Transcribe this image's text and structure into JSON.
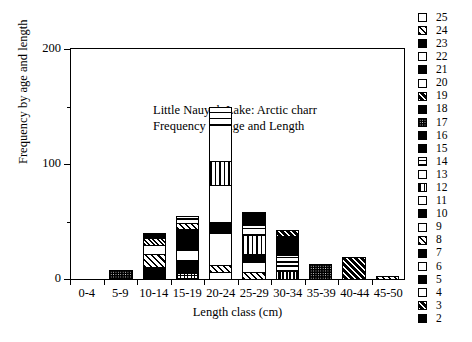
{
  "chart_data": {
    "type": "bar",
    "subtype": "stacked",
    "title": "",
    "annotation": [
      "Little Nauyuk Lake: Arctic charr",
      "Frequency by Age and Length"
    ],
    "xlabel": "Length class (cm)",
    "ylabel": "Frequency by age and length",
    "categories": [
      "0-4",
      "5-9",
      "10-14",
      "15-19",
      "20-24",
      "25-29",
      "30-34",
      "35-39",
      "40-44",
      "45-50"
    ],
    "ylim": [
      0,
      200
    ],
    "yticks": [
      0,
      100,
      200
    ],
    "yticks_minor": [
      50,
      150
    ],
    "ytick_labels": [
      "0",
      "100",
      "200"
    ],
    "grid": false,
    "legend_position": "right",
    "legend_title": "",
    "legend_entries": [
      {
        "label": "25",
        "pattern": "gray-light"
      },
      {
        "label": "24",
        "pattern": "diagonal-right"
      },
      {
        "label": "23",
        "pattern": "gray-dark"
      },
      {
        "label": "22",
        "pattern": "white"
      },
      {
        "label": "21",
        "pattern": "solid-black"
      },
      {
        "label": "20",
        "pattern": "white"
      },
      {
        "label": "19",
        "pattern": "diagonal-dense"
      },
      {
        "label": "18",
        "pattern": "solid-black"
      },
      {
        "label": "17",
        "pattern": "black-dots"
      },
      {
        "label": "16",
        "pattern": "solid-black"
      },
      {
        "label": "15",
        "pattern": "solid-black"
      },
      {
        "label": "14",
        "pattern": "horizontal-lines"
      },
      {
        "label": "13",
        "pattern": "white"
      },
      {
        "label": "12",
        "pattern": "vertical-lines"
      },
      {
        "label": "11",
        "pattern": "white"
      },
      {
        "label": "10",
        "pattern": "solid-black"
      },
      {
        "label": "9",
        "pattern": "gray-light"
      },
      {
        "label": "8",
        "pattern": "diagonal-right"
      },
      {
        "label": "7",
        "pattern": "gray-dark"
      },
      {
        "label": "6",
        "pattern": "white"
      },
      {
        "label": "5",
        "pattern": "solid-black"
      },
      {
        "label": "4",
        "pattern": "white"
      },
      {
        "label": "3",
        "pattern": "diagonal-dense"
      },
      {
        "label": "2",
        "pattern": "solid-black"
      }
    ],
    "totals": [
      0,
      8,
      40,
      55,
      150,
      58,
      43,
      13,
      19,
      3
    ],
    "stacks": [
      {
        "category": "0-4",
        "total": 0,
        "segments": []
      },
      {
        "category": "5-9",
        "total": 8,
        "segments": [
          {
            "age": "2",
            "value": 8,
            "pattern": "black-dots"
          }
        ]
      },
      {
        "category": "10-14",
        "total": 40,
        "segments": [
          {
            "age": "2",
            "value": 10,
            "pattern": "solid-black"
          },
          {
            "age": "3",
            "value": 11,
            "pattern": "diagonal-right"
          },
          {
            "age": "4",
            "value": 8,
            "pattern": "white"
          },
          {
            "age": "5",
            "value": 7,
            "pattern": "checkered"
          },
          {
            "age": "6",
            "value": 4,
            "pattern": "solid-black"
          }
        ]
      },
      {
        "category": "15-19",
        "total": 55,
        "segments": [
          {
            "age": "2",
            "value": 4,
            "pattern": "grid"
          },
          {
            "age": "3",
            "value": 12,
            "pattern": "solid-black"
          },
          {
            "age": "4",
            "value": 9,
            "pattern": "white"
          },
          {
            "age": "5",
            "value": 12,
            "pattern": "solid-black"
          },
          {
            "age": "6",
            "value": 6,
            "pattern": "gray-dark"
          },
          {
            "age": "7",
            "value": 6,
            "pattern": "diagonal-right"
          },
          {
            "age": "8",
            "value": 3,
            "pattern": "white"
          },
          {
            "age": "9",
            "value": 3,
            "pattern": "horizontal-lines"
          }
        ]
      },
      {
        "category": "20-24",
        "total": 150,
        "segments": [
          {
            "age": "4",
            "value": 5,
            "pattern": "white"
          },
          {
            "age": "5",
            "value": 6,
            "pattern": "diagonal-right"
          },
          {
            "age": "6",
            "value": 28,
            "pattern": "gray-light"
          },
          {
            "age": "7",
            "value": 10,
            "pattern": "solid-black"
          },
          {
            "age": "8",
            "value": 32,
            "pattern": "white"
          },
          {
            "age": "9",
            "value": 21,
            "pattern": "vertical-lines"
          },
          {
            "age": "10",
            "value": 32,
            "pattern": "white"
          },
          {
            "age": "11",
            "value": 16,
            "pattern": "horizontal-lines-wide"
          }
        ]
      },
      {
        "category": "25-29",
        "total": 58,
        "segments": [
          {
            "age": "6",
            "value": 5,
            "pattern": "diagonal-right"
          },
          {
            "age": "7",
            "value": 9,
            "pattern": "gray-light"
          },
          {
            "age": "8",
            "value": 7,
            "pattern": "solid-black"
          },
          {
            "age": "9",
            "value": 17,
            "pattern": "vertical-lines"
          },
          {
            "age": "10",
            "value": 9,
            "pattern": "horizontal-lines-wide"
          },
          {
            "age": "11",
            "value": 11,
            "pattern": "solid-black"
          }
        ]
      },
      {
        "category": "30-34",
        "total": 43,
        "segments": [
          {
            "age": "8",
            "value": 6,
            "pattern": "vertical-lines-black"
          },
          {
            "age": "9",
            "value": 14,
            "pattern": "horizontal-lines"
          },
          {
            "age": "10",
            "value": 17,
            "pattern": "solid-black"
          },
          {
            "age": "11",
            "value": 6,
            "pattern": "diagonal-dense"
          }
        ]
      },
      {
        "category": "35-39",
        "total": 13,
        "segments": [
          {
            "age": "12",
            "value": 13,
            "pattern": "black-dots"
          }
        ]
      },
      {
        "category": "40-44",
        "total": 19,
        "segments": [
          {
            "age": "14",
            "value": 19,
            "pattern": "diagonal-dense"
          }
        ]
      },
      {
        "category": "45-50",
        "total": 3,
        "segments": [
          {
            "age": "16",
            "value": 3,
            "pattern": "diagonal-right"
          }
        ]
      }
    ]
  },
  "colors": {
    "ink": "#000000",
    "paper": "#ffffff"
  }
}
